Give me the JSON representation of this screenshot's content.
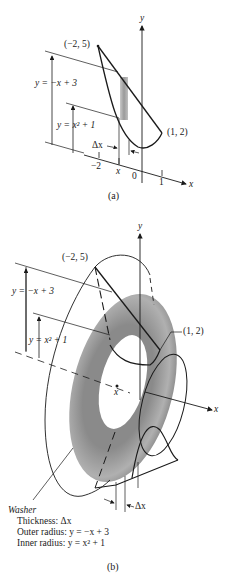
{
  "figure_a": {
    "caption": "(a)",
    "axes": {
      "y_label": "y",
      "x_label": "x"
    },
    "x_ticks": [
      "−2",
      "x",
      "0",
      "1"
    ],
    "points": [
      {
        "label": "(−2, 5)"
      },
      {
        "label": "(1, 2)"
      }
    ],
    "curve_labels": {
      "outer": "y = −x + 3",
      "inner": "y = x² + 1"
    },
    "delta_label": "Δx",
    "colors": {
      "line": "#1a1a1a",
      "strip": "#a0a0a0"
    }
  },
  "figure_b": {
    "caption": "(b)",
    "axes": {
      "y_label": "y",
      "x_label": "x"
    },
    "center_label": "x",
    "points": [
      {
        "label": "(−2, 5)"
      },
      {
        "label": "(1, 2)"
      }
    ],
    "curve_labels": {
      "outer": "y = −x + 3",
      "inner": "y = x² + 1"
    },
    "delta_label": "Δx",
    "washer": {
      "title": "Washer",
      "rows": [
        "Thickness: Δx",
        "Outer radius: y = −x + 3",
        "Inner radius: y = x² + 1"
      ]
    },
    "colors": {
      "line": "#1a1a1a",
      "washer_dark": "#6e6e6e",
      "washer_light": "#b5b5b5"
    }
  }
}
